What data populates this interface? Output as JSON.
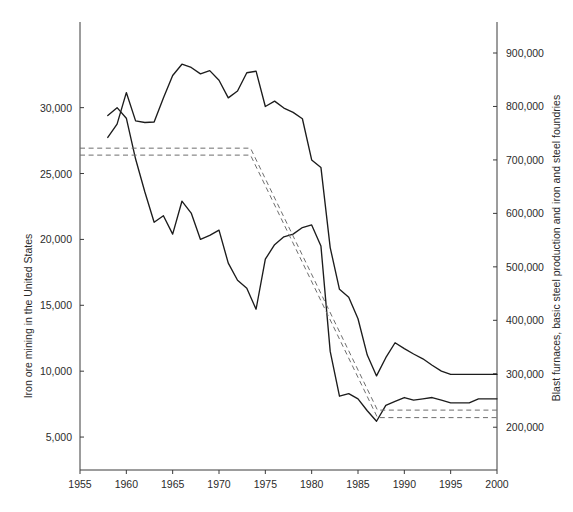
{
  "chart_data": {
    "type": "line",
    "title": "",
    "xlabel": "",
    "ylabel": "Iron ore mining in the United States",
    "y2label": "Blast furnaces, basic steel production and iron and steel foundries",
    "grid": false,
    "legend": "none",
    "xlim": [
      1955,
      2000
    ],
    "xticks": [
      1955,
      1960,
      1965,
      1970,
      1975,
      1980,
      1985,
      1990,
      1995,
      2000
    ],
    "xticklabels": [
      "1955",
      "1960",
      "1965",
      "1970",
      "1975",
      "1980",
      "1985",
      "1990",
      "1995",
      "2000"
    ],
    "ylim": [
      2500,
      36500
    ],
    "yticks": [
      5000,
      10000,
      15000,
      20000,
      25000,
      30000
    ],
    "yticklabels": [
      "5,000",
      "10,000",
      "15,000",
      "20,000",
      "25,000",
      "30,000"
    ],
    "y2lim": [
      120000,
      958000
    ],
    "y2ticks": [
      200000,
      300000,
      400000,
      500000,
      600000,
      700000,
      800000,
      900000
    ],
    "y2ticklabels": [
      "200,000",
      "300,000",
      "400,000",
      "500,000",
      "600,000",
      "700,000",
      "800,000",
      "900,000"
    ],
    "series": [
      {
        "name": "Blast furnaces, basic steel production and iron and steel foundries",
        "axis": "right",
        "style": "solid",
        "color": "#1c1c1c",
        "x": [
          1958,
          1959,
          1960,
          1961,
          1962,
          1963,
          1964,
          1965,
          1966,
          1967,
          1968,
          1969,
          1970,
          1971,
          1972,
          1973,
          1974,
          1975,
          1976,
          1977,
          1978,
          1979,
          1980,
          1981,
          1982,
          1983,
          1984,
          1985,
          1986,
          1987,
          1988,
          1989,
          1990,
          1991,
          1992,
          1993,
          1994,
          1995,
          1996,
          1997,
          1998,
          1999,
          2000
        ],
        "y": [
          742000,
          767000,
          826000,
          773000,
          770000,
          771000,
          816000,
          858000,
          879000,
          873000,
          861000,
          867000,
          849000,
          816000,
          829000,
          863000,
          866000,
          800000,
          810000,
          797000,
          789000,
          777000,
          700000,
          686000,
          536000,
          458000,
          443000,
          403000,
          335000,
          296000,
          330000,
          358000,
          347000,
          337000,
          328000,
          316000,
          305000,
          299000,
          299000,
          299000,
          299000,
          299000,
          299000
        ]
      },
      {
        "name": "Iron ore mining in the United States",
        "axis": "left",
        "style": "solid",
        "color": "#1c1c1c",
        "x": [
          1958,
          1959,
          1960,
          1961,
          1962,
          1963,
          1964,
          1965,
          1966,
          1967,
          1968,
          1969,
          1970,
          1971,
          1972,
          1973,
          1974,
          1975,
          1976,
          1977,
          1978,
          1979,
          1980,
          1981,
          1982,
          1983,
          1984,
          1985,
          1986,
          1987,
          1988,
          1989,
          1990,
          1991,
          1992,
          1993,
          1994,
          1995,
          1996,
          1997,
          1998,
          1999,
          2000
        ],
        "y": [
          29400,
          30000,
          29200,
          26100,
          23600,
          21300,
          21800,
          20400,
          22900,
          22000,
          20000,
          20300,
          20700,
          18200,
          16900,
          16300,
          14700,
          18500,
          19600,
          20200,
          20400,
          20900,
          21100,
          19500,
          11500,
          8100,
          8300,
          7900,
          7000,
          6200,
          7400,
          7700,
          8000,
          7800,
          7900,
          8000,
          7800,
          7600,
          7600,
          7600,
          7900,
          7900,
          7900
        ]
      },
      {
        "name": "Upper trend band (dashed)",
        "axis": "right",
        "style": "dashed",
        "color": "#6e6e6e",
        "x": [
          1955,
          1973.4,
          1987.1,
          2000
        ],
        "y": [
          722000,
          722000,
          232000,
          232000
        ]
      },
      {
        "name": "Lower trend band (dashed)",
        "axis": "right",
        "style": "dashed",
        "color": "#6e6e6e",
        "x": [
          1955,
          1973.4,
          1987.1,
          2000
        ],
        "y": [
          709000,
          709000,
          218000,
          218000
        ]
      }
    ]
  }
}
